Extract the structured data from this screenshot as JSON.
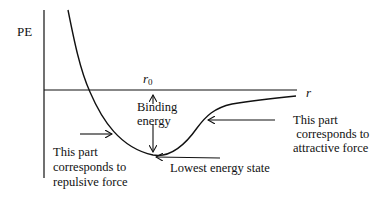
{
  "diagram": {
    "type": "potential-energy-curve",
    "axes": {
      "y_label": "PE",
      "x_label": "r",
      "equilibrium_label_base": "r",
      "equilibrium_label_sub": "0"
    },
    "annotations": {
      "binding_energy_line1": "Binding",
      "binding_energy_line2": "energy",
      "lowest_energy": "Lowest energy state",
      "repulsive_line1": "This part",
      "repulsive_line2": "corresponds to",
      "repulsive_line3": "repulsive force",
      "attractive_line1": "This part",
      "attractive_line2": " corresponds to",
      "attractive_line3": "attractive force"
    },
    "colors": {
      "line": "#111111",
      "background": "#ffffff"
    }
  }
}
